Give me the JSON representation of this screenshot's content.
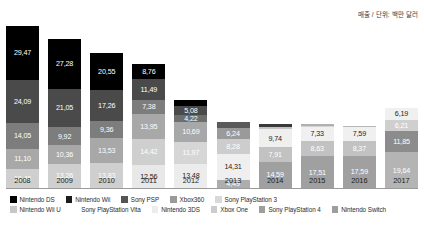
{
  "unit_note": "매출 / 단위: 백만 달러",
  "chart_data": {
    "type": "bar",
    "stacked": true,
    "title": "",
    "subtitle": "",
    "xlabel": "",
    "ylabel": "",
    "unit_note": "매출 / 단위: 백만 달러",
    "grid": false,
    "legend_position": "bottom",
    "categories": [
      "2008",
      "2009",
      "2010",
      "2011",
      "2012",
      "2013",
      "2014",
      "2015",
      "2016",
      "2017"
    ],
    "series": [
      {
        "name": "Nintendo DS",
        "color": "#000000",
        "values": [
          29.47,
          27.28,
          20.55,
          8.76,
          null,
          null,
          null,
          null,
          null,
          null
        ]
      },
      {
        "name": "Nintendo Wii",
        "color": "#3f3f3f",
        "values": [
          24.09,
          21.05,
          17.26,
          7.38,
          5.08,
          null,
          null,
          null,
          null,
          null
        ]
      },
      {
        "name": "Sony PSP",
        "color": "#5e5e5e",
        "values": [
          14.05,
          9.92,
          9.36,
          13.95,
          4.22,
          null,
          null,
          null,
          null,
          null
        ]
      },
      {
        "name": "Xbox360",
        "color": "#8f8f8f",
        "values": [
          11.1,
          10.36,
          13.53,
          14.42,
          10.69,
          6.24,
          null,
          null,
          null,
          null
        ]
      },
      {
        "name": "Sony PlayStation 3",
        "color": "#c9c9c9",
        "values": [
          10.46,
          13.26,
          13.83,
          12.56,
          11.97,
          8.28,
          null,
          null,
          null,
          null
        ]
      },
      {
        "name": "Nintendo Wii U",
        "color": "#d8d8d8",
        "values": [
          null,
          null,
          null,
          null,
          13.48,
          14.31,
          9.74,
          7.33,
          7.59,
          6.19
        ]
      },
      {
        "name": "Sony PlayStation Vita",
        "color": "#ededed",
        "values": [
          null,
          null,
          null,
          null,
          null,
          4.49,
          7.91,
          8.63,
          8.37,
          6.21
        ]
      },
      {
        "name": "Nintendo 3DS",
        "color": "#efefef",
        "values": [
          null,
          null,
          null,
          null,
          null,
          null,
          14.59,
          17.51,
          17.59,
          11.85
        ]
      },
      {
        "name": "Xbox One",
        "color": "#b5b5b5",
        "values": [
          null,
          null,
          null,
          null,
          null,
          null,
          null,
          null,
          null,
          19.64
        ]
      },
      {
        "name": "Sony PlayStation 4",
        "color": "#9c9c9c",
        "values": [
          null,
          null,
          null,
          null,
          null,
          null,
          null,
          null,
          null,
          null
        ]
      },
      {
        "name": "Nintendo Switch",
        "color": "#848484",
        "values": [
          null,
          null,
          null,
          null,
          null,
          null,
          null,
          null,
          null,
          null
        ]
      }
    ],
    "columns": [
      {
        "year": "2008",
        "total": 89.17,
        "segments": [
          {
            "label": "29,47",
            "value": 29.47,
            "color": "#000000",
            "text": "#ffffff",
            "series": "Nintendo DS"
          },
          {
            "label": "24,09",
            "value": 24.09,
            "color": "#4a4a4a",
            "text": "#ffffff",
            "series": "Nintendo Wii"
          },
          {
            "label": "14,05",
            "value": 14.05,
            "color": "#7d7d7d",
            "text": "#ffffff",
            "series": "Sony PSP"
          },
          {
            "label": "11,10",
            "value": 11.1,
            "color": "#a8a8a8",
            "text": "#ffffff",
            "series": "Xbox360"
          },
          {
            "label": "10,46",
            "value": 10.46,
            "color": "#cfcfcf",
            "text": "#ffffff",
            "series": "Sony PlayStation 3"
          }
        ]
      },
      {
        "year": "2009",
        "total": 81.87,
        "segments": [
          {
            "label": "27,28",
            "value": 27.28,
            "color": "#000000",
            "text": "#ffffff",
            "series": "Nintendo DS"
          },
          {
            "label": "21,05",
            "value": 21.05,
            "color": "#4a4a4a",
            "text": "#ffffff",
            "series": "Nintendo Wii"
          },
          {
            "label": "9,92",
            "value": 9.92,
            "color": "#7d7d7d",
            "text": "#ffffff",
            "series": "Sony PSP"
          },
          {
            "label": "10,36",
            "value": 10.36,
            "color": "#a8a8a8",
            "text": "#ffffff",
            "series": "Xbox360"
          },
          {
            "label": "13,26",
            "value": 13.26,
            "color": "#cfcfcf",
            "text": "#ffffff",
            "series": "Sony PlayStation 3"
          }
        ]
      },
      {
        "year": "2010",
        "total": 74.53,
        "segments": [
          {
            "label": "20,55",
            "value": 20.55,
            "color": "#000000",
            "text": "#ffffff",
            "series": "Nintendo DS"
          },
          {
            "label": "17,26",
            "value": 17.26,
            "color": "#4a4a4a",
            "text": "#ffffff",
            "series": "Nintendo Wii"
          },
          {
            "label": "9,36",
            "value": 9.36,
            "color": "#7d7d7d",
            "text": "#ffffff",
            "series": "Sony PSP"
          },
          {
            "label": "13,53",
            "value": 13.53,
            "color": "#a8a8a8",
            "text": "#ffffff",
            "series": "Xbox360"
          },
          {
            "label": "13,83",
            "value": 13.83,
            "color": "#cfcfcf",
            "text": "#ffffff",
            "series": "Sony PlayStation 3"
          }
        ]
      },
      {
        "year": "2011",
        "total": 57.07,
        "segments": [
          {
            "label": "8,76",
            "value": 8.76,
            "color": "#000000",
            "text": "#ffffff",
            "series": "Nintendo DS"
          },
          {
            "label": "11,49",
            "value": 11.49,
            "color": "#4a4a4a",
            "text": "#ffffff",
            "series": "Nintendo Wii"
          },
          {
            "label": "7,38",
            "value": 7.38,
            "color": "#7d7d7d",
            "text": "#ffffff",
            "series": "Sony PSP"
          },
          {
            "label": "13,95",
            "value": 13.95,
            "color": "#a8a8a8",
            "text": "#ffffff",
            "series": "Xbox360"
          },
          {
            "label": "14,42",
            "value": 14.42,
            "color": "#cfcfcf",
            "text": "#ffffff",
            "series": "Sony PlayStation 3"
          },
          {
            "label": "12,56",
            "value": 12.56,
            "color": "#e8e8e8",
            "text": "#1d1d1d",
            "series": "Nintendo Wii U"
          }
        ]
      },
      {
        "year": "2012",
        "total": 45.44,
        "segments": [
          {
            "label": "",
            "value": 3.2,
            "color": "#000000",
            "text": "#ffffff",
            "series": "Nintendo DS"
          },
          {
            "label": "5,08",
            "value": 5.08,
            "color": "#4a4a4a",
            "text": "#ffffff",
            "series": "Nintendo Wii"
          },
          {
            "label": "4,22",
            "value": 4.22,
            "color": "#6e6e6e",
            "text": "#ffffff",
            "series": "Sony PSP"
          },
          {
            "label": "10,69",
            "value": 10.69,
            "color": "#a8a8a8",
            "text": "#ffffff",
            "series": "Xbox360"
          },
          {
            "label": "11,97",
            "value": 11.97,
            "color": "#d6d6d6",
            "text": "#ffffff",
            "series": "Sony PlayStation 3"
          },
          {
            "label": "13,48",
            "value": 13.48,
            "color": "#ececec",
            "text": "#1d1d1d",
            "series": "Nintendo Wii U"
          }
        ]
      },
      {
        "year": "2013",
        "total": 36.52,
        "segments": [
          {
            "label": "",
            "value": 3.2,
            "color": "#5a5a5a",
            "text": "#ffffff",
            "series": "Sony PSP"
          },
          {
            "label": "6,24",
            "value": 6.24,
            "color": "#9a9a9a",
            "text": "#ffffff",
            "series": "Xbox360"
          },
          {
            "label": "8,28",
            "value": 8.28,
            "color": "#cdcdcd",
            "text": "#ffffff",
            "series": "Sony PlayStation 3"
          },
          {
            "label": "14,31",
            "value": 14.31,
            "color": "#efefef",
            "text": "#1d1d1d",
            "series": "Nintendo Wii U"
          },
          {
            "label": "4,49",
            "value": 4.49,
            "color": "#adadad",
            "text": "#ffffff",
            "series": "Sony PlayStation Vita"
          }
        ]
      },
      {
        "year": "2014",
        "total": 35.44,
        "segments": [
          {
            "label": "",
            "value": 1.8,
            "color": "#3a3a3a",
            "text": "#ffffff",
            "series": "Xbox360"
          },
          {
            "label": "",
            "value": 1.4,
            "color": "#c4c4c4",
            "text": "#ffffff",
            "series": "Sony PlayStation 3"
          },
          {
            "label": "9,74",
            "value": 9.74,
            "color": "#efefef",
            "text": "#1d1d1d",
            "series": "Nintendo Wii U"
          },
          {
            "label": "7,91",
            "value": 7.91,
            "color": "#c2c2c2",
            "text": "#ffffff",
            "series": "Sony PlayStation Vita"
          },
          {
            "label": "14,59",
            "value": 14.59,
            "color": "#a0a0a0",
            "text": "#ffffff",
            "series": "Nintendo 3DS"
          }
        ]
      },
      {
        "year": "2015",
        "total": 35.37,
        "segments": [
          {
            "label": "",
            "value": 0.95,
            "color": "#b0b0b0",
            "text": "#ffffff",
            "series": "Xbox360"
          },
          {
            "label": "",
            "value": 0.95,
            "color": "#d4d4d4",
            "text": "#ffffff",
            "series": "Sony PlayStation 3"
          },
          {
            "label": "7,33",
            "value": 7.33,
            "color": "#f0f0f0",
            "text": "#1d1d1d",
            "series": "Nintendo Wii U"
          },
          {
            "label": "8,63",
            "value": 8.63,
            "color": "#c2c2c2",
            "text": "#ffffff",
            "series": "Sony PlayStation Vita"
          },
          {
            "label": "17,51",
            "value": 17.51,
            "color": "#a0a0a0",
            "text": "#ffffff",
            "series": "Nintendo 3DS"
          }
        ]
      },
      {
        "year": "2016",
        "total": 34.2,
        "segments": [
          {
            "label": "",
            "value": 0.65,
            "color": "#b8b8b8",
            "text": "#ffffff",
            "series": "Sony PlayStation 3"
          },
          {
            "label": "7,59",
            "value": 7.59,
            "color": "#f0f0f0",
            "text": "#1d1d1d",
            "series": "Nintendo Wii U"
          },
          {
            "label": "8,37",
            "value": 8.37,
            "color": "#c2c2c2",
            "text": "#ffffff",
            "series": "Sony PlayStation Vita"
          },
          {
            "label": "17,59",
            "value": 17.59,
            "color": "#a0a0a0",
            "text": "#ffffff",
            "series": "Nintendo 3DS"
          }
        ]
      },
      {
        "year": "2017",
        "total": 43.89,
        "segments": [
          {
            "label": "6,19",
            "value": 6.19,
            "color": "#f0f0f0",
            "text": "#1d1d1d",
            "series": "Nintendo Wii U"
          },
          {
            "label": "6,21",
            "value": 6.21,
            "color": "#cfcfcf",
            "text": "#ffffff",
            "series": "Sony PlayStation Vita"
          },
          {
            "label": "11,85",
            "value": 11.85,
            "color": "#8c8c8c",
            "text": "#ffffff",
            "series": "Nintendo 3DS"
          },
          {
            "label": "19,64",
            "value": 19.64,
            "color": "#b4b4b4",
            "text": "#ffffff",
            "series": "Xbox One"
          }
        ]
      }
    ],
    "legend": {
      "row1": [
        {
          "label": "Nintendo DS",
          "color": "#000000"
        },
        {
          "label": "Nintendo Wii",
          "color": "#1c1c1c"
        },
        {
          "label": "Sony PSP",
          "color": "#555555"
        },
        {
          "label": "Xbox360",
          "color": "#9a9a9a"
        },
        {
          "label": "Sony PlayStation 3",
          "color": "#d9d9d9"
        }
      ],
      "row2": [
        {
          "label": "Nintendo Wii U",
          "color": "#c7c7c7"
        },
        {
          "label": "Sony PlayStation Vita",
          "color": "#ffffff"
        },
        {
          "label": "Nintendo 3DS",
          "color": "#ececec"
        },
        {
          "label": "Xbox One",
          "color": "#cccccc"
        },
        {
          "label": "Sony PlayStation 4",
          "color": "#9e9e9e"
        },
        {
          "label": "Nintendo Switch",
          "color": "#9e9e9e"
        }
      ]
    }
  }
}
